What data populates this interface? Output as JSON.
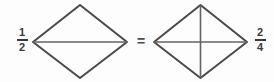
{
  "equation": {
    "left_fraction": {
      "numerator": "1",
      "denominator": "2"
    },
    "equals_sign": "=",
    "right_fraction": {
      "numerator": "2",
      "denominator": "4"
    }
  },
  "shapes": {
    "left_diamond": {
      "description": "diamond split into 2 equal triangles by a horizontal line",
      "parts": 2
    },
    "right_diamond": {
      "description": "diamond split into 4 equal triangles by a horizontal and a vertical line",
      "parts": 4
    }
  },
  "colors": {
    "shape_outline": "#4a4a4a",
    "divider_line": "#636363",
    "text": "#3a3a3a",
    "background": "#fdfdfd"
  }
}
